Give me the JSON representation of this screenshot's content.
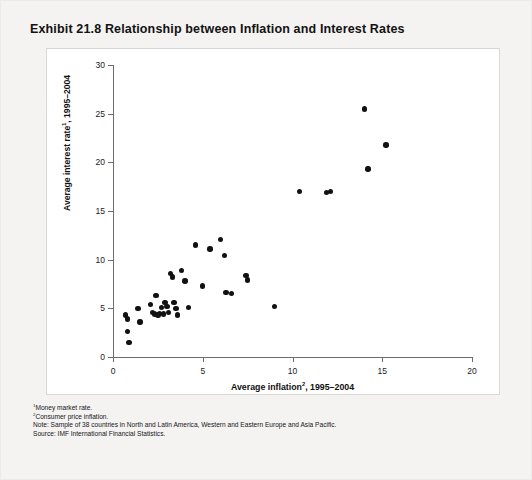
{
  "figure": {
    "title": "Exhibit 21.8 Relationship between Inflation and Interest Rates",
    "panel_background": "#ffffff",
    "page_background": "#f4f3f1",
    "marker_color": "#111111",
    "axis_color": "#6d6d6d"
  },
  "notes": [
    {
      "marker": "1",
      "text": "Money market rate."
    },
    {
      "marker": "2",
      "text": "Consumer price inflation."
    },
    {
      "marker": "",
      "text": "Note: Sample of 38 countries in North and Latin America, Western and Eastern Europe and Asia Pacific."
    },
    {
      "marker": "",
      "text": "Source: IMF International Financial Statistics."
    }
  ],
  "axis_labels": {
    "x_prefix": "Average inflation",
    "x_sup": "2",
    "x_suffix": ", 1995–2004",
    "y_prefix": "Average interest rate",
    "y_sup": "1",
    "y_suffix": ", 1995–2004"
  },
  "chart_data": {
    "type": "scatter",
    "title": "Exhibit 21.8 Relationship between Inflation and Interest Rates",
    "xlabel": "Average inflation2, 1995–2004",
    "ylabel": "Average interest rate1, 1995–2004",
    "xlim": [
      0,
      20
    ],
    "ylim": [
      0,
      30
    ],
    "xticks": [
      0,
      5,
      10,
      15,
      20
    ],
    "yticks": [
      0,
      5,
      10,
      15,
      20,
      25,
      30
    ],
    "grid": false,
    "legend": "none",
    "n_points": 38,
    "points": [
      [
        0.7,
        4.3
      ],
      [
        0.8,
        3.9
      ],
      [
        0.8,
        2.6
      ],
      [
        0.9,
        1.5
      ],
      [
        1.4,
        5.0
      ],
      [
        1.5,
        3.6
      ],
      [
        2.1,
        5.4
      ],
      [
        2.2,
        4.6
      ],
      [
        2.3,
        4.4
      ],
      [
        2.4,
        6.3
      ],
      [
        2.5,
        4.3
      ],
      [
        2.6,
        4.5
      ],
      [
        2.7,
        5.1
      ],
      [
        2.8,
        4.4
      ],
      [
        2.9,
        5.6
      ],
      [
        3.0,
        5.2
      ],
      [
        3.1,
        4.6
      ],
      [
        3.2,
        8.6
      ],
      [
        3.3,
        8.2
      ],
      [
        3.4,
        5.6
      ],
      [
        3.5,
        5.0
      ],
      [
        3.6,
        4.3
      ],
      [
        3.8,
        8.9
      ],
      [
        4.0,
        7.8
      ],
      [
        4.2,
        5.1
      ],
      [
        4.6,
        11.5
      ],
      [
        5.0,
        7.3
      ],
      [
        5.4,
        11.1
      ],
      [
        6.0,
        12.1
      ],
      [
        6.2,
        10.4
      ],
      [
        6.3,
        6.6
      ],
      [
        6.6,
        6.5
      ],
      [
        7.4,
        8.4
      ],
      [
        7.5,
        7.9
      ],
      [
        9.0,
        5.2
      ],
      [
        10.4,
        17.0
      ],
      [
        11.9,
        16.9
      ],
      [
        12.1,
        17.0
      ],
      [
        14.0,
        25.5
      ],
      [
        14.2,
        19.3
      ],
      [
        15.2,
        21.8
      ]
    ]
  }
}
